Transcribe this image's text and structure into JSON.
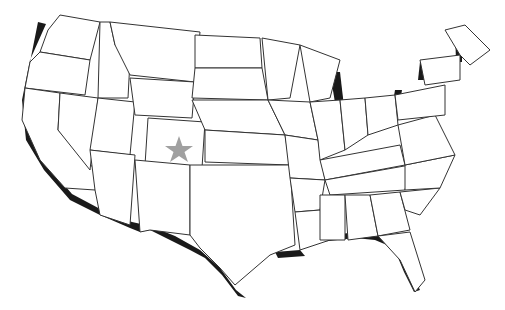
{
  "map": {
    "subject": "United States (contiguous) outline map",
    "marker": {
      "shape": "star",
      "state": "Colorado",
      "color": "#a0a0a0"
    },
    "colors": {
      "fill": "#ffffff",
      "stroke": "#333333",
      "shadow": "#1a1a1a"
    }
  }
}
